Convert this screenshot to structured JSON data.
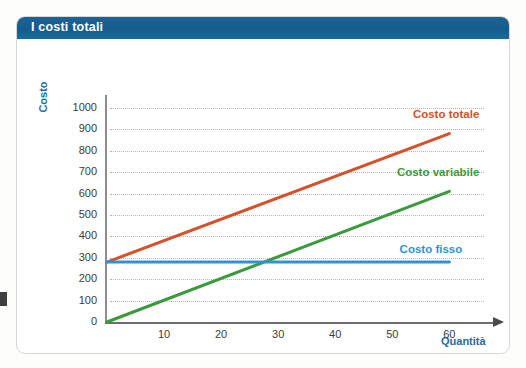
{
  "title": "I costi totali",
  "axis": {
    "y_title": "Costo",
    "x_title": "Quantità"
  },
  "colors": {
    "banner": "#1b5f8f",
    "axis_title": "#1d6ca3",
    "costo_totale": "#d4512a",
    "costo_variabile": "#3a9a3c",
    "costo_fisso": "#2e93d4",
    "grid": "#b6b6b6",
    "tick_text": "#3b3b3b"
  },
  "chart_data": {
    "type": "line",
    "title": "I costi totali",
    "xlabel": "Quantità",
    "ylabel": "Costo",
    "xlim": [
      0,
      68
    ],
    "ylim": [
      0,
      1060
    ],
    "grid": true,
    "legend": "inline-right",
    "x_ticks": [
      10,
      20,
      30,
      40,
      50,
      60
    ],
    "y_ticks": [
      0,
      100,
      200,
      300,
      400,
      500,
      600,
      700,
      800,
      900,
      1000
    ],
    "series": [
      {
        "name": "Costo totale",
        "color": "#d4512a",
        "label_x": 60,
        "label_y": 960,
        "x": [
          0,
          60
        ],
        "values": [
          280,
          880
        ]
      },
      {
        "name": "Costo variabile",
        "color": "#3a9a3c",
        "label_x": 60,
        "label_y": 690,
        "x": [
          0,
          60
        ],
        "values": [
          0,
          610
        ]
      },
      {
        "name": "Costo fisso",
        "color": "#2e93d4",
        "label_x": 57,
        "label_y": 330,
        "x": [
          0,
          60
        ],
        "values": [
          280,
          280
        ]
      }
    ]
  }
}
